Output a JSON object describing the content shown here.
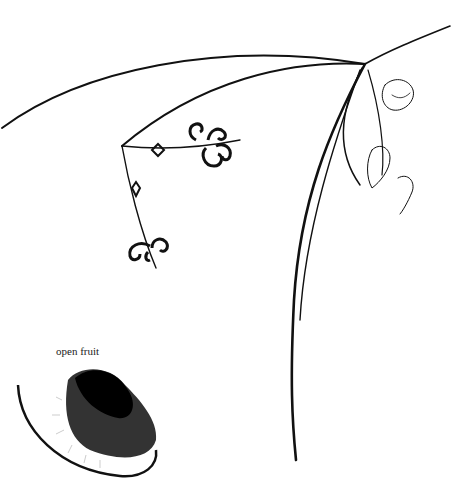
{
  "illustration": {
    "subject": "botanical line drawing of a vine with flowers and fruits",
    "annotations": [
      {
        "text": "open fruit"
      }
    ]
  },
  "colors": {
    "ink": "#111111",
    "background": "#ffffff"
  }
}
